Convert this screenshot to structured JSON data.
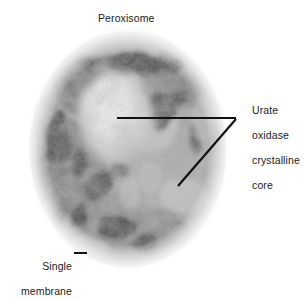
{
  "figure": {
    "kind": "electron-micrograph",
    "subject": "Peroxisome",
    "background_color": "#ffffff",
    "organelle": {
      "shape": "ovoid",
      "matrix_tone": "#8f8f8f",
      "dark_patch_tone": "#262626",
      "core_tone": "#f2f2f2",
      "halo_tone": "#f7f7f7"
    }
  },
  "labels": {
    "peroxisome": "Peroxisome",
    "core": {
      "line1": "Urate",
      "line2": "oxidase",
      "line3": "crystalline",
      "line4": "core"
    },
    "membrane": {
      "line1": "Single",
      "line2": "membrane"
    }
  },
  "leaders": {
    "core_horizontal": "from crystalline core to label vertex",
    "core_diagonal": "from matrix granule to label vertex",
    "membrane_dash": "from Single label to membrane edge"
  },
  "colors": {
    "text": "#1c1c1c",
    "leader_line": "#111111"
  }
}
